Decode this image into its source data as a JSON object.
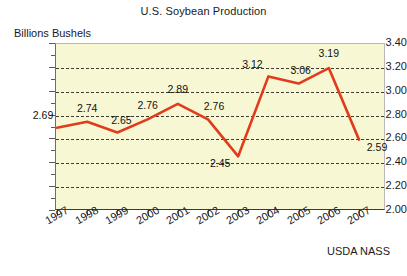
{
  "chart_data": {
    "type": "line",
    "title": "U.S. Soybean Production",
    "xlabel": "",
    "ylabel": "Billions Bushels",
    "source": "USDA NASS",
    "categories": [
      "1997",
      "1998",
      "1999",
      "2000",
      "2001",
      "2002",
      "2003",
      "2004",
      "2005",
      "2006",
      "2007"
    ],
    "values": [
      2.69,
      2.74,
      2.65,
      2.76,
      2.89,
      2.76,
      2.45,
      3.12,
      3.06,
      3.19,
      2.59
    ],
    "point_labels": [
      "2.69",
      "2.74",
      "2.65",
      "2.76",
      "2.89",
      "2.76",
      "2.45",
      "3.12",
      "3.06",
      "3.19",
      "2.59"
    ],
    "ylim": [
      2.0,
      3.4
    ],
    "ytick_values": [
      3.4,
      3.2,
      3.0,
      2.8,
      2.6,
      2.4,
      2.2,
      2.0
    ],
    "ytick_labels": [
      "3.40",
      "3.20",
      "3.00",
      "2.80",
      "2.60",
      "2.40",
      "2.20",
      "2.00"
    ],
    "grid": true,
    "grid_style": "dashed-horizontal",
    "legend": "none",
    "series_color": "#e03c1c",
    "plot_background": "#f8f7d4",
    "axis_color": "#3a3a3a",
    "grid_color": "#3c3c32"
  }
}
